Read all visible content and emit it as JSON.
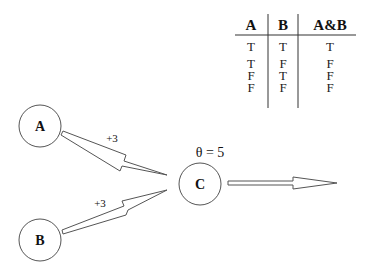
{
  "truth_table": {
    "headers": [
      "A",
      "B",
      "A&B"
    ],
    "rows": [
      [
        "T",
        "T",
        "T"
      ],
      [
        "T",
        "F",
        "F"
      ],
      [
        "F",
        "T",
        "F"
      ],
      [
        "F",
        "F",
        "F"
      ]
    ]
  },
  "nodes": {
    "a": {
      "label": "A"
    },
    "b": {
      "label": "B"
    },
    "c": {
      "label": "C"
    }
  },
  "edges": {
    "a_to_c": {
      "weight": "+3"
    },
    "b_to_c": {
      "weight": "+3"
    }
  },
  "threshold": {
    "label": "θ = 5"
  },
  "colors": {
    "stroke": "#444444",
    "text": "#111111",
    "background": "#ffffff"
  }
}
